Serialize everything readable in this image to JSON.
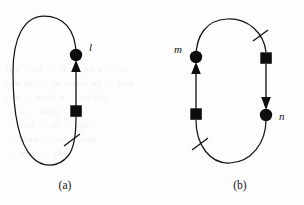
{
  "figure": {
    "background_color": "#fdfdfd",
    "ink_color": "#121212",
    "panels": [
      {
        "id": "panel-a",
        "caption": "(a)",
        "caption_x": 65,
        "caption_y": 189,
        "loop": {
          "cx": 46,
          "cy": 95,
          "rx": 33,
          "ry": 70,
          "shape": "oval"
        },
        "nodes": [
          {
            "name": "circle-node-l",
            "type": "circle",
            "label": "l",
            "x": 76,
            "y": 55,
            "r": 6.2,
            "label_x": 89,
            "label_y": 50
          },
          {
            "name": "square-node-a",
            "type": "square",
            "label": "",
            "x": 76,
            "y": 111,
            "size": 11.5
          }
        ],
        "arrows": [
          {
            "name": "arrow-up-to-l",
            "from_x": 76,
            "from_y": 105,
            "to_x": 76,
            "to_y": 62,
            "direction": "up"
          }
        ],
        "ticks": [
          {
            "name": "tick-mark-a",
            "x": 71,
            "y": 141,
            "angle": 42
          }
        ]
      },
      {
        "id": "panel-b",
        "caption": "(b)",
        "caption_x": 240,
        "caption_y": 189,
        "loop": {
          "cx": 231,
          "cy": 95,
          "rx": 36,
          "ry": 70,
          "shape": "oval"
        },
        "nodes": [
          {
            "name": "circle-node-m",
            "type": "circle",
            "label": "m",
            "x": 196,
            "y": 57,
            "r": 6.2,
            "label_x": 178,
            "label_y": 52
          },
          {
            "name": "square-node-b-left",
            "type": "square",
            "label": "",
            "x": 196,
            "y": 114,
            "size": 11.5
          },
          {
            "name": "square-node-b-right",
            "type": "square",
            "label": "",
            "x": 266,
            "y": 58,
            "size": 11.5
          },
          {
            "name": "circle-node-n",
            "type": "circle",
            "label": "n",
            "x": 266,
            "y": 115,
            "r": 6.2,
            "label_x": 278,
            "label_y": 119
          }
        ],
        "arrows": [
          {
            "name": "arrow-up-to-m",
            "from_x": 196,
            "from_y": 108,
            "to_x": 196,
            "to_y": 64,
            "direction": "up"
          },
          {
            "name": "arrow-down-to-n",
            "from_x": 266,
            "from_y": 64,
            "to_x": 266,
            "to_y": 108,
            "direction": "down"
          }
        ],
        "ticks": [
          {
            "name": "tick-mark-b-top",
            "x": 261,
            "y": 36,
            "angle": 145
          },
          {
            "name": "tick-mark-b-bottom",
            "x": 200,
            "y": 144,
            "angle": 40
          }
        ]
      }
    ]
  },
  "ghost_lines": [
    {
      "text": "the ...ed ... through a ... of",
      "x": 6,
      "y": 70
    },
    {
      "text": "can be ... in terms of ... and",
      "x": 6,
      "y": 84
    },
    {
      "text": "the ... with a ... of the",
      "x": 6,
      "y": 98
    },
    {
      "text": "... a ... loop ... is",
      "x": 6,
      "y": 112
    },
    {
      "text": "... and ... of ... the",
      "x": 6,
      "y": 126
    },
    {
      "text": "... then ... of ... and",
      "x": 6,
      "y": 140
    },
    {
      "text": "... may ... the",
      "x": 6,
      "y": 154
    }
  ]
}
